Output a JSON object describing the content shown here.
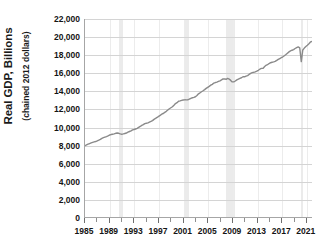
{
  "chart_data": {
    "type": "line",
    "title": "",
    "xlabel": "",
    "ylabel": "Real GDP, Billions",
    "ylabel_sub": "(chained 2012 dollars)",
    "ylim": [
      0,
      22000
    ],
    "xlim": [
      1985,
      2022
    ],
    "grid": true,
    "legend": "none",
    "line_color": "#8a8a8a",
    "axis_color": "#a6a6a6",
    "gridline_color": "#d4d4d4",
    "recession_band_color": "#ebebeb",
    "y_ticks": [
      {
        "value": 0,
        "label": "0"
      },
      {
        "value": 2000,
        "label": "2,000"
      },
      {
        "value": 4000,
        "label": "4,000"
      },
      {
        "value": 6000,
        "label": "6,000"
      },
      {
        "value": 8000,
        "label": "8,000"
      },
      {
        "value": 10000,
        "label": "10,000"
      },
      {
        "value": 12000,
        "label": "12,000"
      },
      {
        "value": 14000,
        "label": "14,000"
      },
      {
        "value": 16000,
        "label": "16,000"
      },
      {
        "value": 18000,
        "label": "18,000"
      },
      {
        "value": 20000,
        "label": "20,000"
      },
      {
        "value": 22000,
        "label": "22,000"
      }
    ],
    "x_tick_values": [
      1985,
      1987,
      1989,
      1991,
      1993,
      1995,
      1997,
      1999,
      2001,
      2003,
      2005,
      2007,
      2009,
      2011,
      2013,
      2015,
      2017,
      2019,
      2021
    ],
    "x_tick_labels": [
      {
        "value": 1985,
        "label": "1985"
      },
      {
        "value": 1989,
        "label": "1989"
      },
      {
        "value": 1993,
        "label": "1993"
      },
      {
        "value": 1997,
        "label": "1997"
      },
      {
        "value": 2001,
        "label": "2001"
      },
      {
        "value": 2005,
        "label": "2005"
      },
      {
        "value": 2009,
        "label": "2009"
      },
      {
        "value": 2013,
        "label": "2013"
      },
      {
        "value": 2017,
        "label": "2017"
      },
      {
        "value": 2021,
        "label": "2021"
      }
    ],
    "recession_bands": [
      {
        "start": 1990.5,
        "end": 1991.2
      },
      {
        "start": 2001.2,
        "end": 2001.9
      },
      {
        "start": 2007.9,
        "end": 2009.4
      },
      {
        "start": 2020.1,
        "end": 2020.4
      }
    ],
    "series": [
      {
        "name": "Real GDP",
        "x": [
          1985.0,
          1985.25,
          1985.5,
          1985.75,
          1986.0,
          1986.25,
          1986.5,
          1986.75,
          1987.0,
          1987.25,
          1987.5,
          1987.75,
          1988.0,
          1988.25,
          1988.5,
          1988.75,
          1989.0,
          1989.25,
          1989.5,
          1989.75,
          1990.0,
          1990.25,
          1990.5,
          1990.75,
          1991.0,
          1991.25,
          1991.5,
          1991.75,
          1992.0,
          1992.25,
          1992.5,
          1992.75,
          1993.0,
          1993.25,
          1993.5,
          1993.75,
          1994.0,
          1994.25,
          1994.5,
          1994.75,
          1995.0,
          1995.25,
          1995.5,
          1995.75,
          1996.0,
          1996.25,
          1996.5,
          1996.75,
          1997.0,
          1997.25,
          1997.5,
          1997.75,
          1998.0,
          1998.25,
          1998.5,
          1998.75,
          1999.0,
          1999.25,
          1999.5,
          1999.75,
          2000.0,
          2000.25,
          2000.5,
          2000.75,
          2001.0,
          2001.25,
          2001.5,
          2001.75,
          2002.0,
          2002.25,
          2002.5,
          2002.75,
          2003.0,
          2003.25,
          2003.5,
          2003.75,
          2004.0,
          2004.25,
          2004.5,
          2004.75,
          2005.0,
          2005.25,
          2005.5,
          2005.75,
          2006.0,
          2006.25,
          2006.5,
          2006.75,
          2007.0,
          2007.25,
          2007.5,
          2007.75,
          2008.0,
          2008.25,
          2008.5,
          2008.75,
          2009.0,
          2009.25,
          2009.5,
          2009.75,
          2010.0,
          2010.25,
          2010.5,
          2010.75,
          2011.0,
          2011.25,
          2011.5,
          2011.75,
          2012.0,
          2012.25,
          2012.5,
          2012.75,
          2013.0,
          2013.25,
          2013.5,
          2013.75,
          2014.0,
          2014.25,
          2014.5,
          2014.75,
          2015.0,
          2015.25,
          2015.5,
          2015.75,
          2016.0,
          2016.25,
          2016.5,
          2016.75,
          2017.0,
          2017.25,
          2017.5,
          2017.75,
          2018.0,
          2018.25,
          2018.5,
          2018.75,
          2019.0,
          2019.25,
          2019.5,
          2019.75,
          2020.0,
          2020.25,
          2020.5,
          2020.75,
          2021.0,
          2021.25,
          2021.5,
          2021.75,
          2022.0
        ],
        "values": [
          7920,
          8010,
          8090,
          8160,
          8230,
          8290,
          8340,
          8390,
          8450,
          8530,
          8620,
          8730,
          8810,
          8880,
          8940,
          9020,
          9110,
          9160,
          9200,
          9230,
          9300,
          9330,
          9300,
          9230,
          9200,
          9230,
          9280,
          9330,
          9420,
          9500,
          9570,
          9680,
          9720,
          9780,
          9840,
          9950,
          10060,
          10180,
          10270,
          10380,
          10420,
          10460,
          10540,
          10620,
          10710,
          10850,
          10950,
          11060,
          11180,
          11290,
          11420,
          11500,
          11630,
          11740,
          11890,
          12030,
          12140,
          12250,
          12420,
          12600,
          12700,
          12860,
          12900,
          12960,
          13000,
          13020,
          13010,
          13030,
          13090,
          13190,
          13250,
          13290,
          13360,
          13500,
          13690,
          13800,
          13920,
          14030,
          14150,
          14290,
          14410,
          14520,
          14650,
          14740,
          14880,
          14940,
          14990,
          15070,
          15130,
          15230,
          15340,
          15350,
          15300,
          15400,
          15330,
          15180,
          15010,
          15010,
          15110,
          15240,
          15320,
          15400,
          15470,
          15580,
          15580,
          15660,
          15710,
          15840,
          15960,
          16040,
          16080,
          16130,
          16200,
          16300,
          16420,
          16510,
          16510,
          16700,
          16850,
          16920,
          17050,
          17140,
          17190,
          17230,
          17290,
          17400,
          17520,
          17610,
          17700,
          17800,
          17920,
          18050,
          18200,
          18350,
          18450,
          18530,
          18600,
          18720,
          18820,
          18900,
          18800,
          17260,
          18560,
          18770,
          18940,
          19080,
          19250,
          19450,
          19500
        ]
      }
    ]
  }
}
